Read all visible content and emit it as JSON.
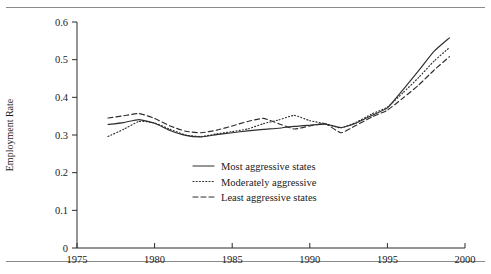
{
  "figure": {
    "has_top_rule": true,
    "has_bottom_rule": true,
    "background": "#ffffff",
    "ink_color": "#2e2e2e"
  },
  "chart_data": {
    "type": "line",
    "title": "",
    "subtitle": "",
    "xlabel": "",
    "ylabel": "Employment Rate",
    "xlim": [
      1975,
      2000
    ],
    "ylim": [
      0,
      0.6
    ],
    "xticks": [
      1975,
      1980,
      1985,
      1990,
      1995,
      2000
    ],
    "xtick_labels": [
      "1975",
      "1980",
      "1985",
      "1990",
      "1995",
      "2000"
    ],
    "yticks": [
      0,
      0.1,
      0.2,
      0.3,
      0.4,
      0.5,
      0.6
    ],
    "ytick_labels": [
      "0",
      "0.1",
      "0.2",
      "0.3",
      "0.4",
      "0.5",
      "0.6"
    ],
    "grid": false,
    "legend_position": "inside-lower-center",
    "x": [
      1977,
      1978,
      1979,
      1980,
      1981,
      1982,
      1983,
      1984,
      1985,
      1986,
      1987,
      1988,
      1989,
      1990,
      1991,
      1992,
      1993,
      1994,
      1995,
      1996,
      1997,
      1998,
      1999
    ],
    "series": [
      {
        "name": "Most aggressive states",
        "style": "solid",
        "values": [
          0.328,
          0.333,
          0.341,
          0.331,
          0.312,
          0.299,
          0.295,
          0.301,
          0.306,
          0.311,
          0.315,
          0.318,
          0.323,
          0.326,
          0.329,
          0.32,
          0.332,
          0.352,
          0.372,
          0.42,
          0.47,
          0.522,
          0.558
        ]
      },
      {
        "name": "Moderately aggressive",
        "style": "dotted",
        "values": [
          0.296,
          0.315,
          0.336,
          0.332,
          0.315,
          0.3,
          0.296,
          0.303,
          0.309,
          0.316,
          0.33,
          0.34,
          0.352,
          0.338,
          0.33,
          0.319,
          0.334,
          0.356,
          0.374,
          0.412,
          0.452,
          0.496,
          0.532
        ]
      },
      {
        "name": "Least aggressive states",
        "style": "dashed",
        "values": [
          0.345,
          0.351,
          0.357,
          0.344,
          0.324,
          0.31,
          0.306,
          0.313,
          0.324,
          0.336,
          0.344,
          0.33,
          0.316,
          0.324,
          0.33,
          0.306,
          0.326,
          0.348,
          0.366,
          0.398,
          0.432,
          0.472,
          0.508
        ]
      }
    ]
  },
  "legend": {
    "items": [
      {
        "label": "Most aggressive states",
        "style": "solid"
      },
      {
        "label": "Moderately aggressive",
        "style": "dotted"
      },
      {
        "label": "Least aggressive states",
        "style": "dashed"
      }
    ]
  }
}
